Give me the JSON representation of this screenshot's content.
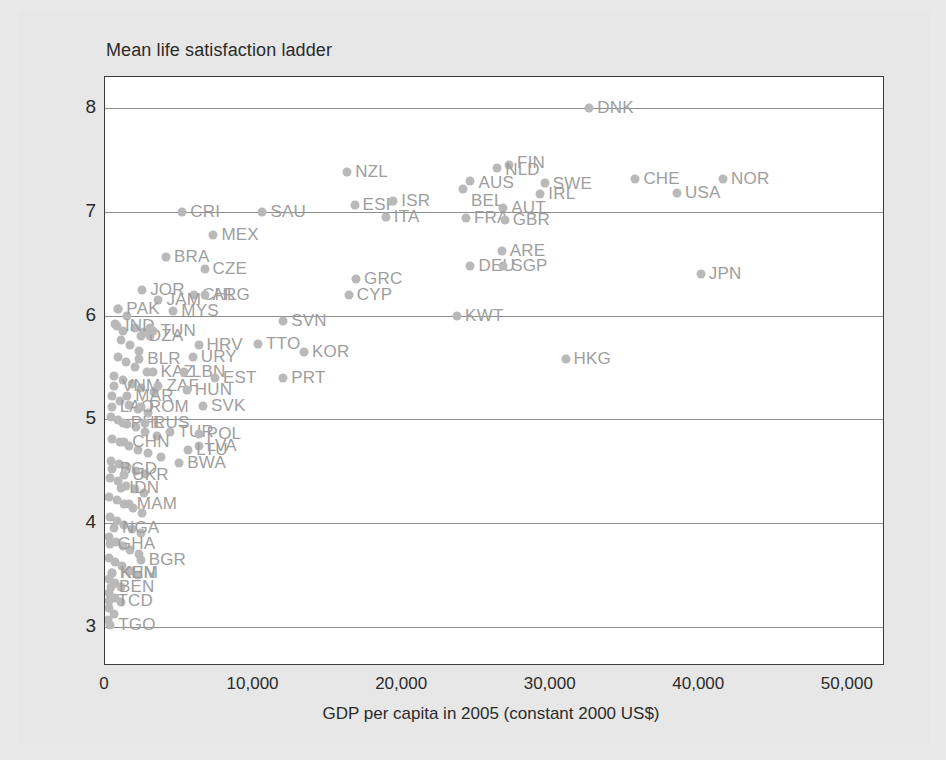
{
  "chart_data": {
    "type": "scatter",
    "title": "Mean life satisfaction ladder",
    "xlabel": "GDP per capita in 2005 (constant 2000 US$)",
    "ylabel": "Mean life satisfaction ladder",
    "xlim": [
      0,
      52500
    ],
    "ylim": [
      2.62,
      8.3
    ],
    "xticks": [
      0,
      10000,
      20000,
      30000,
      40000,
      50000
    ],
    "xticklabels": [
      "0",
      "10,000",
      "20,000",
      "30,000",
      "40,000",
      "50,000"
    ],
    "yticks": [
      3,
      4,
      5,
      6,
      7,
      8
    ],
    "yticklabels": [
      "3",
      "4",
      "5",
      "6",
      "7",
      "8"
    ],
    "grid": "horizontal",
    "legend": "none",
    "point_color": "#b9b9b9",
    "label_color": "#9e9e9e",
    "axis_color": "#3a3a3a",
    "grid_color": "#8d8d8d",
    "plot_bg": "#ffffff",
    "page_bg": "#e7e7e7",
    "points": [
      {
        "label": "DNK",
        "x": 32600,
        "y": 8.0,
        "lx": 8,
        "ly": 0
      },
      {
        "label": "FIN",
        "x": 27200,
        "y": 7.45,
        "lx": 8,
        "ly": -2
      },
      {
        "label": "NLD",
        "x": 26400,
        "y": 7.42,
        "lx": 8,
        "ly": 2
      },
      {
        "label": "AUS",
        "x": 24600,
        "y": 7.3,
        "lx": 8,
        "ly": 2
      },
      {
        "label": "BEL",
        "x": 24100,
        "y": 7.22,
        "lx": 8,
        "ly": 12
      },
      {
        "label": "SWE",
        "x": 29600,
        "y": 7.28,
        "lx": 8,
        "ly": 1
      },
      {
        "label": "CHE",
        "x": 35700,
        "y": 7.32,
        "lx": 8,
        "ly": 0
      },
      {
        "label": "NOR",
        "x": 41600,
        "y": 7.32,
        "lx": 8,
        "ly": 0
      },
      {
        "label": "IRL",
        "x": 29300,
        "y": 7.17,
        "lx": 8,
        "ly": 0
      },
      {
        "label": "USA",
        "x": 38500,
        "y": 7.18,
        "lx": 8,
        "ly": 0
      },
      {
        "label": "NZL",
        "x": 16300,
        "y": 7.38,
        "lx": 8,
        "ly": 0
      },
      {
        "label": "ESP",
        "x": 16800,
        "y": 7.07,
        "lx": 8,
        "ly": 0
      },
      {
        "label": "ISR",
        "x": 19400,
        "y": 7.1,
        "lx": 8,
        "ly": 0
      },
      {
        "label": "CRI",
        "x": 5200,
        "y": 7.0,
        "lx": 8,
        "ly": 0
      },
      {
        "label": "SAU",
        "x": 10600,
        "y": 7.0,
        "lx": 8,
        "ly": 0
      },
      {
        "label": "AUT",
        "x": 26800,
        "y": 7.04,
        "lx": 8,
        "ly": 0
      },
      {
        "label": "ITA",
        "x": 18900,
        "y": 6.95,
        "lx": 8,
        "ly": 0
      },
      {
        "label": "FRA",
        "x": 24300,
        "y": 6.94,
        "lx": 8,
        "ly": 0
      },
      {
        "label": "GBR",
        "x": 26900,
        "y": 6.92,
        "lx": 8,
        "ly": 0
      },
      {
        "label": "MEX",
        "x": 7300,
        "y": 6.78,
        "lx": 8,
        "ly": 0
      },
      {
        "label": "ARE",
        "x": 26700,
        "y": 6.62,
        "lx": 8,
        "ly": 0
      },
      {
        "label": "DEU",
        "x": 24600,
        "y": 6.48,
        "lx": 8,
        "ly": 0
      },
      {
        "label": "SGP",
        "x": 26800,
        "y": 6.48,
        "lx": 8,
        "ly": 0
      },
      {
        "label": "BRA",
        "x": 4100,
        "y": 6.56,
        "lx": 8,
        "ly": 0
      },
      {
        "label": "CZE",
        "x": 6700,
        "y": 6.45,
        "lx": 8,
        "ly": 0
      },
      {
        "label": "JPN",
        "x": 40100,
        "y": 6.4,
        "lx": 8,
        "ly": 0
      },
      {
        "label": "GRC",
        "x": 16900,
        "y": 6.35,
        "lx": 8,
        "ly": 0
      },
      {
        "label": "JOR",
        "x": 2500,
        "y": 6.25,
        "lx": 8,
        "ly": 0
      },
      {
        "label": "CHL",
        "x": 6000,
        "y": 6.2,
        "lx": 8,
        "ly": 0
      },
      {
        "label": "ARG",
        "x": 6700,
        "y": 6.2,
        "lx": 8,
        "ly": 0
      },
      {
        "label": "CYP",
        "x": 16400,
        "y": 6.2,
        "lx": 8,
        "ly": 0
      },
      {
        "label": "JAM",
        "x": 3600,
        "y": 6.15,
        "lx": 8,
        "ly": 0
      },
      {
        "label": "PAK",
        "x": 900,
        "y": 6.06,
        "lx": 8,
        "ly": 0
      },
      {
        "label": "MYS",
        "x": 4600,
        "y": 6.04,
        "lx": 8,
        "ly": 0
      },
      {
        "label": "KWT",
        "x": 23700,
        "y": 6.0,
        "lx": 8,
        "ly": 0
      },
      {
        "label": "IND",
        "x": 800,
        "y": 5.9,
        "lx": 8,
        "ly": 0
      },
      {
        "label": "DZA",
        "x": 2400,
        "y": 5.8,
        "lx": 8,
        "ly": 0
      },
      {
        "label": "CRI2",
        "x": 3000,
        "y": 5.88,
        "lx": 8,
        "ly": 0
      },
      {
        "label": "TUN",
        "x": 3200,
        "y": 5.85,
        "lx": 8,
        "ly": 0
      },
      {
        "label": "HRV",
        "x": 6300,
        "y": 5.72,
        "lx": 8,
        "ly": 0
      },
      {
        "label": "SVN",
        "x": 12000,
        "y": 5.95,
        "lx": 8,
        "ly": 0
      },
      {
        "label": "TTO",
        "x": 10300,
        "y": 5.73,
        "lx": 8,
        "ly": 0
      },
      {
        "label": "KOR",
        "x": 13400,
        "y": 5.65,
        "lx": 8,
        "ly": 0
      },
      {
        "label": "HKG",
        "x": 31000,
        "y": 5.58,
        "lx": 8,
        "ly": 0
      },
      {
        "label": "BLR",
        "x": 2300,
        "y": 5.58,
        "lx": 8,
        "ly": 0
      },
      {
        "label": "URY",
        "x": 5900,
        "y": 5.6,
        "lx": 8,
        "ly": 0
      },
      {
        "label": "KAZ",
        "x": 3200,
        "y": 5.46,
        "lx": 8,
        "ly": 0
      },
      {
        "label": "LBN",
        "x": 5300,
        "y": 5.46,
        "lx": 8,
        "ly": 0
      },
      {
        "label": "EST",
        "x": 7400,
        "y": 5.4,
        "lx": 8,
        "ly": 0
      },
      {
        "label": "PRT",
        "x": 12000,
        "y": 5.4,
        "lx": 8,
        "ly": 0
      },
      {
        "label": "VNM",
        "x": 600,
        "y": 5.32,
        "lx": 8,
        "ly": 0
      },
      {
        "label": "ZAF",
        "x": 3600,
        "y": 5.32,
        "lx": 8,
        "ly": 0
      },
      {
        "label": "HUN",
        "x": 5500,
        "y": 5.28,
        "lx": 8,
        "ly": 0
      },
      {
        "label": "SVK",
        "x": 6600,
        "y": 5.13,
        "lx": 8,
        "ly": 0
      },
      {
        "label": "LAO",
        "x": 450,
        "y": 5.12,
        "lx": 8,
        "ly": 0
      },
      {
        "label": "ROM",
        "x": 2400,
        "y": 5.12,
        "lx": 8,
        "ly": 0
      },
      {
        "label": "MAR",
        "x": 1500,
        "y": 5.22,
        "lx": 8,
        "ly": 0
      },
      {
        "label": "PHL",
        "x": 1200,
        "y": 4.96,
        "lx": 8,
        "ly": 0
      },
      {
        "label": "RUS",
        "x": 2700,
        "y": 4.96,
        "lx": 8,
        "ly": 0
      },
      {
        "label": "TUR",
        "x": 4400,
        "y": 4.88,
        "lx": 8,
        "ly": 0
      },
      {
        "label": "POL",
        "x": 6300,
        "y": 4.86,
        "lx": 8,
        "ly": 0
      },
      {
        "label": "CHN",
        "x": 1300,
        "y": 4.78,
        "lx": 8,
        "ly": 0
      },
      {
        "label": "LVA",
        "x": 6300,
        "y": 4.74,
        "lx": 8,
        "ly": 0
      },
      {
        "label": "LTU",
        "x": 5600,
        "y": 4.7,
        "lx": 8,
        "ly": 0
      },
      {
        "label": "BWA",
        "x": 5000,
        "y": 4.58,
        "lx": 8,
        "ly": 0
      },
      {
        "label": "BGD",
        "x": 450,
        "y": 4.52,
        "lx": 8,
        "ly": 0
      },
      {
        "label": "UKR",
        "x": 1300,
        "y": 4.46,
        "lx": 8,
        "ly": 0
      },
      {
        "label": "IDN",
        "x": 1100,
        "y": 4.34,
        "lx": 8,
        "ly": 0
      },
      {
        "label": "MAM",
        "x": 1600,
        "y": 4.18,
        "lx": 8,
        "ly": 0
      },
      {
        "label": "NGA",
        "x": 600,
        "y": 3.95,
        "lx": 8,
        "ly": 0
      },
      {
        "label": "GHA",
        "x": 320,
        "y": 3.8,
        "lx": 8,
        "ly": 0
      },
      {
        "label": "BGR",
        "x": 2400,
        "y": 3.64,
        "lx": 8,
        "ly": 0
      },
      {
        "label": "KEN",
        "x": 500,
        "y": 3.52,
        "lx": 8,
        "ly": 0
      },
      {
        "label": "KHM",
        "x": 450,
        "y": 3.52,
        "lx": 8,
        "ly": 0
      },
      {
        "label": "BEN",
        "x": 400,
        "y": 3.38,
        "lx": 8,
        "ly": 0
      },
      {
        "label": "TCD",
        "x": 300,
        "y": 3.25,
        "lx": 8,
        "ly": 0
      },
      {
        "label": "TGO",
        "x": 350,
        "y": 3.02,
        "lx": 8,
        "ly": 0
      }
    ],
    "unlabeled_points": [
      {
        "x": 900,
        "y": 6.06
      },
      {
        "x": 1500,
        "y": 6.0
      },
      {
        "x": 700,
        "y": 5.92
      },
      {
        "x": 1200,
        "y": 5.85
      },
      {
        "x": 2000,
        "y": 5.88
      },
      {
        "x": 2600,
        "y": 5.84
      },
      {
        "x": 3000,
        "y": 5.8
      },
      {
        "x": 1100,
        "y": 5.76
      },
      {
        "x": 1700,
        "y": 5.72
      },
      {
        "x": 2300,
        "y": 5.66
      },
      {
        "x": 900,
        "y": 5.6
      },
      {
        "x": 1400,
        "y": 5.55
      },
      {
        "x": 2000,
        "y": 5.5
      },
      {
        "x": 2800,
        "y": 5.46
      },
      {
        "x": 600,
        "y": 5.42
      },
      {
        "x": 1200,
        "y": 5.38
      },
      {
        "x": 1800,
        "y": 5.34
      },
      {
        "x": 2400,
        "y": 5.3
      },
      {
        "x": 3300,
        "y": 5.26
      },
      {
        "x": 500,
        "y": 5.22
      },
      {
        "x": 1000,
        "y": 5.18
      },
      {
        "x": 1600,
        "y": 5.14
      },
      {
        "x": 2200,
        "y": 5.1
      },
      {
        "x": 2900,
        "y": 5.06
      },
      {
        "x": 400,
        "y": 5.02
      },
      {
        "x": 900,
        "y": 4.99
      },
      {
        "x": 1500,
        "y": 4.95
      },
      {
        "x": 2100,
        "y": 4.92
      },
      {
        "x": 2700,
        "y": 4.88
      },
      {
        "x": 3500,
        "y": 4.84
      },
      {
        "x": 450,
        "y": 4.81
      },
      {
        "x": 1000,
        "y": 4.78
      },
      {
        "x": 1600,
        "y": 4.74
      },
      {
        "x": 2200,
        "y": 4.7
      },
      {
        "x": 2900,
        "y": 4.67
      },
      {
        "x": 3800,
        "y": 4.64
      },
      {
        "x": 400,
        "y": 4.6
      },
      {
        "x": 950,
        "y": 4.57
      },
      {
        "x": 1500,
        "y": 4.54
      },
      {
        "x": 2100,
        "y": 4.5
      },
      {
        "x": 2700,
        "y": 4.47
      },
      {
        "x": 350,
        "y": 4.43
      },
      {
        "x": 850,
        "y": 4.4
      },
      {
        "x": 1400,
        "y": 4.36
      },
      {
        "x": 2000,
        "y": 4.33
      },
      {
        "x": 2600,
        "y": 4.29
      },
      {
        "x": 300,
        "y": 4.25
      },
      {
        "x": 800,
        "y": 4.22
      },
      {
        "x": 1300,
        "y": 4.18
      },
      {
        "x": 1900,
        "y": 4.14
      },
      {
        "x": 2500,
        "y": 4.1
      },
      {
        "x": 320,
        "y": 4.06
      },
      {
        "x": 780,
        "y": 4.02
      },
      {
        "x": 1250,
        "y": 3.98
      },
      {
        "x": 1800,
        "y": 3.94
      },
      {
        "x": 2400,
        "y": 3.9
      },
      {
        "x": 300,
        "y": 3.86
      },
      {
        "x": 750,
        "y": 3.82
      },
      {
        "x": 1200,
        "y": 3.78
      },
      {
        "x": 1700,
        "y": 3.74
      },
      {
        "x": 2300,
        "y": 3.7
      },
      {
        "x": 280,
        "y": 3.66
      },
      {
        "x": 700,
        "y": 3.62
      },
      {
        "x": 1150,
        "y": 3.58
      },
      {
        "x": 1650,
        "y": 3.54
      },
      {
        "x": 2200,
        "y": 3.5
      },
      {
        "x": 260,
        "y": 3.46
      },
      {
        "x": 680,
        "y": 3.42
      },
      {
        "x": 1100,
        "y": 3.38
      },
      {
        "x": 250,
        "y": 3.32
      },
      {
        "x": 640,
        "y": 3.28
      },
      {
        "x": 1050,
        "y": 3.24
      },
      {
        "x": 240,
        "y": 3.18
      },
      {
        "x": 600,
        "y": 3.12
      },
      {
        "x": 230,
        "y": 3.06
      }
    ]
  }
}
